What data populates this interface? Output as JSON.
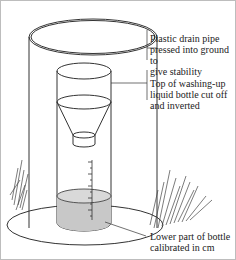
{
  "diagram": {
    "type": "labelled-illustration",
    "labels": [
      {
        "id": "pipe",
        "text_lines": [
          "Plastic drain pipe",
          "pressed into ground to",
          "give stability"
        ]
      },
      {
        "id": "funnel",
        "text_lines": [
          "Top of washing-up",
          "liquid bottle cut off",
          "and inverted"
        ]
      },
      {
        "id": "bottle",
        "text_lines": [
          "Lower part of bottle",
          "calibrated in cm"
        ]
      }
    ],
    "colors": {
      "line": "#333333",
      "water": "#c8c8c8",
      "background": "#ffffff"
    }
  }
}
